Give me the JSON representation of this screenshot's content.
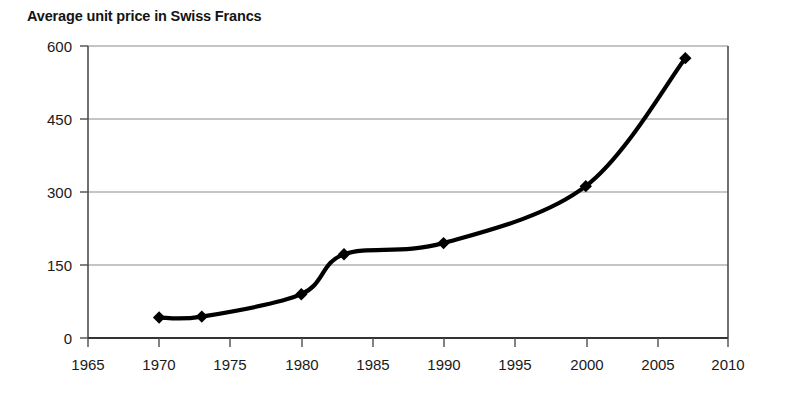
{
  "chart_data": {
    "type": "line",
    "title": "Average unit price in Swiss Francs",
    "xlabel": "",
    "ylabel": "",
    "x": [
      1970,
      1973,
      1980,
      1983,
      1990,
      2000,
      2007
    ],
    "values": [
      42,
      44,
      90,
      172,
      195,
      312,
      575
    ],
    "series": [
      {
        "name": "Average unit price",
        "x": [
          1970,
          1973,
          1980,
          1983,
          1990,
          2000,
          2007
        ],
        "values": [
          42,
          44,
          90,
          172,
          195,
          312,
          575
        ]
      }
    ],
    "xlim": [
      1965,
      2010
    ],
    "ylim": [
      0,
      600
    ],
    "xticks": [
      1965,
      1970,
      1975,
      1980,
      1985,
      1990,
      1995,
      2000,
      2005,
      2010
    ],
    "yticks": [
      0,
      150,
      300,
      450,
      600
    ],
    "xtick_labels": [
      "1965",
      "1970",
      "1975",
      "1980",
      "1985",
      "1990",
      "1995",
      "2000",
      "2005",
      "2010"
    ],
    "ytick_labels": [
      "0",
      "150",
      "300",
      "450",
      "600"
    ],
    "grid": "horizontal",
    "legend": "none",
    "marker": "diamond",
    "line_color": "#000000",
    "marker_color": "#000000",
    "grid_color": "#8c8c8c",
    "axis_color": "#4d4d4d",
    "background": "#ffffff"
  }
}
